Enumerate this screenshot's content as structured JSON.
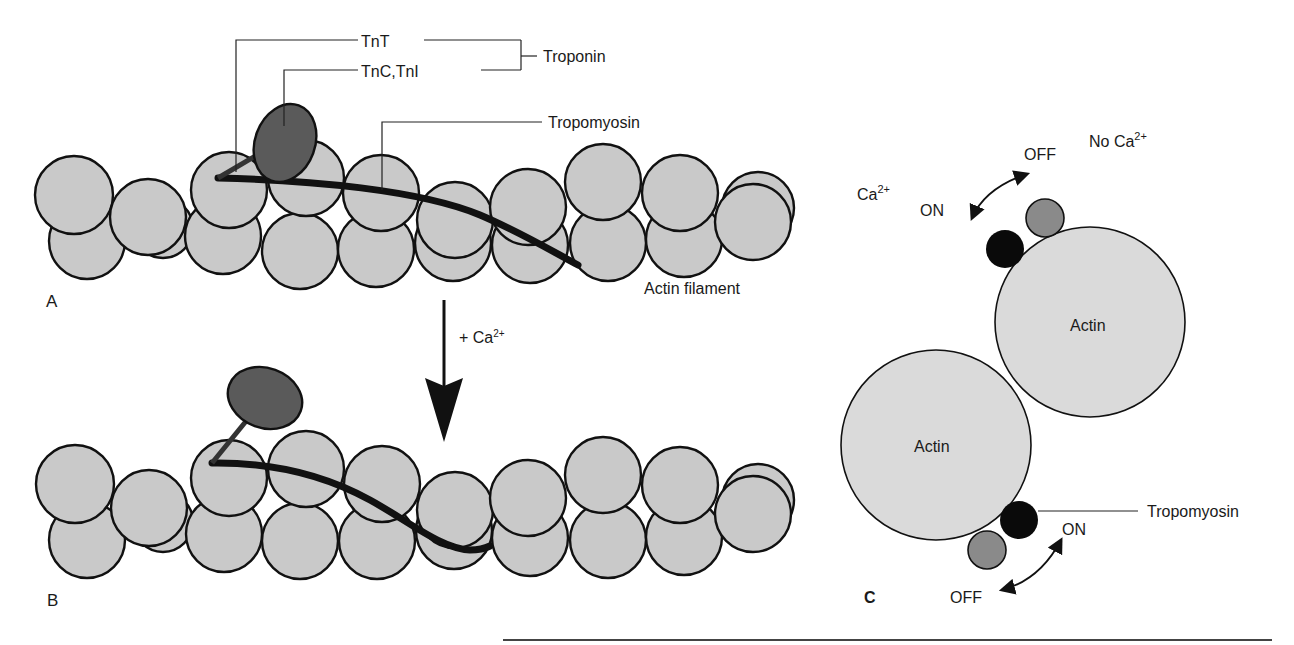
{
  "labels": {
    "tnt": "TnT",
    "tnc_tni": "TnC,TnI",
    "troponin": "Troponin",
    "tropomyosin_a": "Tropomyosin",
    "actin_filament": "Actin filament",
    "panel_a": "A",
    "panel_b": "B",
    "panel_c": "C",
    "plus_ca": "+ Ca",
    "plus_ca_sup": "2+",
    "ca_on_side": "Ca",
    "ca_on_side_sup": "2+",
    "on_top": "ON",
    "off_top": "OFF",
    "no_ca": "No Ca",
    "no_ca_sup": "2+",
    "actin_upper": "Actin",
    "actin_lower": "Actin",
    "tropomyosin_c": "Tropomyosin",
    "on_bottom": "ON",
    "off_bottom": "OFF"
  },
  "colors": {
    "actin_fill": "#c9c9c9",
    "troponin_fill": "#5a5a5a",
    "tropomyosin": "#111111",
    "off_state_fill": "#8a8a8a",
    "on_state_fill": "#0a0a0a"
  }
}
